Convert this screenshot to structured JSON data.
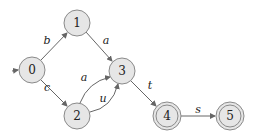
{
  "diagram": {
    "type": "finite-automaton",
    "initial_state": "0",
    "states": [
      {
        "id": "0",
        "label": "0",
        "x": 32,
        "y": 70,
        "accepting": false
      },
      {
        "id": "1",
        "label": "1",
        "x": 77,
        "y": 23,
        "accepting": false
      },
      {
        "id": "2",
        "label": "2",
        "x": 77,
        "y": 116,
        "accepting": false
      },
      {
        "id": "3",
        "label": "3",
        "x": 122,
        "y": 71,
        "accepting": false
      },
      {
        "id": "4",
        "label": "4",
        "x": 167,
        "y": 116,
        "accepting": true
      },
      {
        "id": "5",
        "label": "5",
        "x": 230,
        "y": 116,
        "accepting": true
      }
    ],
    "transitions": [
      {
        "from": "0",
        "to": "1",
        "label": "b"
      },
      {
        "from": "0",
        "to": "2",
        "label": "c"
      },
      {
        "from": "1",
        "to": "3",
        "label": "a"
      },
      {
        "from": "2",
        "to": "3",
        "label": "a"
      },
      {
        "from": "2",
        "to": "3",
        "label": "u"
      },
      {
        "from": "3",
        "to": "4",
        "label": "t"
      },
      {
        "from": "4",
        "to": "5",
        "label": "s"
      }
    ]
  }
}
